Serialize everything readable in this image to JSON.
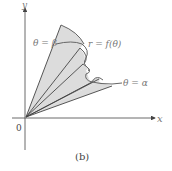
{
  "figure": {
    "caption": "(b)",
    "axis_labels": {
      "x": "x",
      "y": "y",
      "origin": "0"
    },
    "annotations": {
      "theta_beta": "θ = β",
      "theta_alpha": "θ = α",
      "curve": "r = f(θ)"
    },
    "colors": {
      "fill": "#dcdcdc",
      "stroke": "#444444",
      "curve": "#666666",
      "label": "#777777"
    }
  }
}
